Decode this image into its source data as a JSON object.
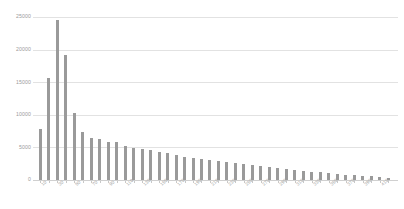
{
  "chart_data": {
    "type": "bar",
    "title": "",
    "subtitle": "",
    "xlabel": "",
    "ylabel": "",
    "ylim": [
      0,
      25000
    ],
    "y_ticks": [
      0,
      5000,
      10000,
      15000,
      20000,
      25000
    ],
    "y_tick_labels": [
      "0",
      "5000",
      "10000",
      "15000",
      "20000",
      "25000"
    ],
    "grid": true,
    "legend": false,
    "legend_position": "none",
    "bar_color": "#9a9a9a",
    "grid_color": "#e2e2e2",
    "axis_text_color": "#9b9b9b",
    "background": "#ffffff",
    "x_tick_label_rotation": -45,
    "x_tick_label_interval": 2,
    "categories": [
      "10",
      "20",
      "30",
      "40",
      "50",
      "60",
      "70",
      "80",
      "90",
      "100",
      "110",
      "120",
      "130",
      "140",
      "150",
      "160",
      "170",
      "180",
      "190",
      "200",
      "210",
      "220",
      "230",
      "240",
      "250",
      "260",
      "270",
      "280",
      "290",
      "300",
      "310",
      "320",
      "330",
      "340",
      "350",
      "360",
      "370",
      "380",
      "390",
      "400",
      "410",
      "420"
    ],
    "x_tick_labels_shown": [
      "10",
      "30",
      "50",
      "70",
      "90",
      "110",
      "130",
      "150",
      "170",
      "190",
      "210",
      "230",
      "250",
      "270",
      "290",
      "310",
      "330",
      "350",
      "370",
      "390"
    ],
    "values": [
      7900,
      15600,
      24500,
      19200,
      10300,
      7300,
      6400,
      6300,
      5900,
      5800,
      5200,
      4900,
      4700,
      4550,
      4350,
      4100,
      3800,
      3500,
      3300,
      3150,
      3000,
      2850,
      2700,
      2550,
      2400,
      2250,
      2100,
      1950,
      1800,
      1680,
      1550,
      1420,
      1300,
      1180,
      1060,
      950,
      840,
      740,
      640,
      540,
      440,
      340
    ]
  }
}
